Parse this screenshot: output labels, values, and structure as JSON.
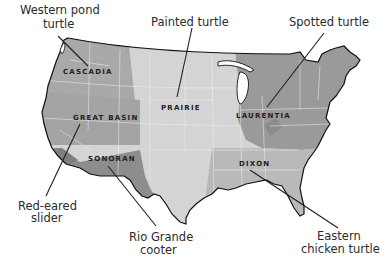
{
  "map": {
    "subject": "Turtle bioregions of the contiguous United States",
    "colors": {
      "background": "#ffffff",
      "cascada": "#a9a9a9",
      "great_basin": "#a4a4a4",
      "sonoran": "#8d8d8d",
      "prairie": "#d4d4d4",
      "laurentia": "#9a9a9a",
      "dixon": "#b9b9b9",
      "coastline": "#111111",
      "state_borders": "#f2f2f2",
      "leader_lines": "#1e1e1e"
    },
    "regions": [
      {
        "id": "cascadia",
        "label": "CASCADIA"
      },
      {
        "id": "great-basin",
        "label": "GREAT BASIN"
      },
      {
        "id": "sonoran",
        "label": "SONORAN"
      },
      {
        "id": "prairie",
        "label": "PRAIRIE"
      },
      {
        "id": "laurentia",
        "label": "LAURENTIA"
      },
      {
        "id": "dixon",
        "label": "DIXON"
      }
    ],
    "species": [
      {
        "id": "western-pond-turtle",
        "lines": [
          "Western pond",
          "turtle"
        ],
        "region": "CASCADIA"
      },
      {
        "id": "painted-turtle",
        "lines": [
          "Painted turtle"
        ],
        "region": "PRAIRIE"
      },
      {
        "id": "spotted-turtle",
        "lines": [
          "Spotted turtle"
        ],
        "region": "LAURENTIA"
      },
      {
        "id": "red-eared-slider",
        "lines": [
          "Red-eared",
          "slider"
        ],
        "region": "GREAT BASIN"
      },
      {
        "id": "rio-grande-cooter",
        "lines": [
          "Rio Grande",
          "cooter"
        ],
        "region": "SONORAN"
      },
      {
        "id": "eastern-chicken-turtle",
        "lines": [
          "Eastern",
          "chicken turtle"
        ],
        "region": "DIXON"
      }
    ]
  }
}
